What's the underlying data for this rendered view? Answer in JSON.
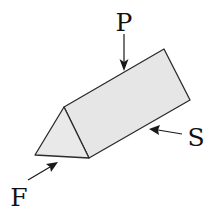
{
  "diagram": {
    "colors": {
      "face_fill": "#e6e6e6",
      "end_face_fill": "#e9e9e9",
      "stroke": "#2b2b2b",
      "background": "#ffffff"
    },
    "shape": "triangular-prism",
    "labels": {
      "P": "P",
      "S": "S",
      "F": "F"
    },
    "arrows": [
      {
        "label": "P",
        "meaning": "plan view direction (from above)"
      },
      {
        "label": "S",
        "meaning": "side view direction"
      },
      {
        "label": "F",
        "meaning": "front view direction (end face)"
      }
    ]
  }
}
